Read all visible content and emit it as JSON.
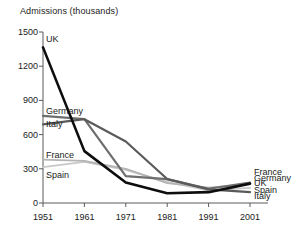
{
  "chart_data": {
    "type": "line",
    "title": "Admissions (thousands)",
    "xlabel": "",
    "ylabel": "Admissions (thousands)",
    "x": [
      1951,
      1961,
      1971,
      1981,
      1991,
      2001
    ],
    "xtick_labels": [
      "1951",
      "1961",
      "1971",
      "1981",
      "1991",
      "2001"
    ],
    "ytick_labels": [
      "0",
      "300",
      "600",
      "900",
      "1200",
      "1500"
    ],
    "yticks": [
      0,
      300,
      600,
      900,
      1200,
      1500
    ],
    "ylim": [
      0,
      1500
    ],
    "xlim": [
      1951,
      2001
    ],
    "grid": false,
    "legend_position": "inline-end-labels",
    "series": [
      {
        "name": "UK",
        "color": "#0d0d0d",
        "width": 2.6,
        "values": [
          1365,
          455,
          180,
          85,
          95,
          170
        ],
        "label_left": "UK",
        "label_right": "UK"
      },
      {
        "name": "Germany",
        "color": "#6e6e6e",
        "width": 2.2,
        "values": [
          765,
          735,
          235,
          210,
          125,
          178
        ],
        "label_left": "Germany",
        "label_right": "Germany"
      },
      {
        "name": "Italy",
        "color": "#5a5a5a",
        "width": 2.2,
        "values": [
          690,
          735,
          540,
          210,
          120,
          95
        ],
        "label_left": "Italy",
        "label_right": "Italy"
      },
      {
        "name": "France",
        "color": "#b4b4b4",
        "width": 1.8,
        "values": [
          380,
          370,
          300,
          175,
          135,
          165
        ],
        "label_left": "France",
        "label_right": "France"
      },
      {
        "name": "Spain",
        "color": "#c8c8c8",
        "width": 1.8,
        "values": [
          315,
          360,
          290,
          185,
          110,
          132
        ],
        "label_left": "Spain",
        "label_right": "Spain"
      }
    ],
    "left_labels": [
      {
        "text": "UK",
        "value": 1440
      },
      {
        "text": "Germany",
        "value": 810
      },
      {
        "text": "Italy",
        "value": 690
      },
      {
        "text": "France",
        "value": 425
      },
      {
        "text": "Spain",
        "value": 250
      }
    ],
    "right_labels": [
      {
        "text": "France",
        "value": 275
      },
      {
        "text": "Germany",
        "value": 222
      },
      {
        "text": "UK",
        "value": 172
      },
      {
        "text": "Spain",
        "value": 118
      },
      {
        "text": "Italy",
        "value": 62
      }
    ],
    "axis_color": "#5a5a5a"
  }
}
